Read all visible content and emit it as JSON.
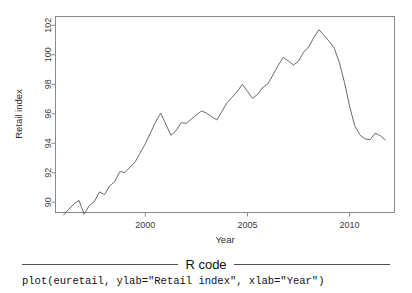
{
  "figure": {
    "name": "euretail-time-plot",
    "y_axis_title": "Retail index",
    "x_axis_title": "Year",
    "y_ticks": [
      "90",
      "92",
      "94",
      "96",
      "98",
      "100",
      "102"
    ],
    "x_ticks": [
      "2000",
      "2005",
      "2010"
    ],
    "line_color": "#5a5a5a",
    "axis_color": "#8a8a8a"
  },
  "rcode": {
    "title": "R code",
    "code": "plot(euretail, ylab=\"Retail index\", xlab=\"Year\")"
  },
  "chart_data": {
    "type": "line",
    "title": "",
    "xlabel": "Year",
    "ylabel": "Retail index",
    "xlim": [
      1996.0,
      1911.75
    ],
    "x_axis_range": [
      1995.6,
      2012.2
    ],
    "ylim": [
      89.3,
      102.6
    ],
    "y_ticks": [
      90,
      92,
      94,
      96,
      98,
      100,
      102
    ],
    "x_ticks": [
      2000,
      2005,
      2010
    ],
    "grid": false,
    "legend": null,
    "series_name": "euretail",
    "frequency": "quarterly",
    "x_start": 1996.0,
    "x_step": 0.25,
    "x": [
      1996.0,
      1996.25,
      1996.5,
      1996.75,
      1997.0,
      1997.25,
      1997.5,
      1997.75,
      1998.0,
      1998.25,
      1998.5,
      1998.75,
      1999.0,
      1999.25,
      1999.5,
      1999.75,
      2000.0,
      2000.25,
      2000.5,
      2000.75,
      2001.0,
      2001.25,
      2001.5,
      2001.75,
      2002.0,
      2002.25,
      2002.5,
      2002.75,
      2003.0,
      2003.25,
      2003.5,
      2003.75,
      2004.0,
      2004.25,
      2004.5,
      2004.75,
      2005.0,
      2005.25,
      2005.5,
      2005.75,
      2006.0,
      2006.25,
      2006.5,
      2006.75,
      2007.0,
      2007.25,
      2007.5,
      2007.75,
      2008.0,
      2008.25,
      2008.5,
      2008.75,
      2009.0,
      2009.25,
      2009.5,
      2009.75,
      2010.0,
      2010.25,
      2010.5,
      2010.75,
      2011.0,
      2011.25,
      2011.5,
      2011.75
    ],
    "values": [
      89.13,
      89.52,
      89.88,
      90.12,
      89.19,
      89.76,
      90.03,
      90.7,
      90.52,
      91.1,
      91.4,
      92.08,
      92.02,
      92.38,
      92.73,
      93.35,
      93.97,
      94.7,
      95.44,
      96.04,
      95.3,
      94.54,
      94.85,
      95.39,
      95.35,
      95.64,
      95.92,
      96.19,
      96.04,
      95.8,
      95.58,
      96.17,
      96.74,
      97.12,
      97.51,
      98.0,
      97.52,
      97.04,
      97.33,
      97.79,
      98.02,
      98.64,
      99.28,
      99.82,
      99.59,
      99.3,
      99.58,
      100.18,
      100.54,
      101.17,
      101.7,
      101.32,
      100.92,
      100.45,
      99.48,
      98.12,
      96.52,
      95.2,
      94.57,
      94.3,
      94.23,
      94.68,
      94.52,
      94.22
    ]
  }
}
